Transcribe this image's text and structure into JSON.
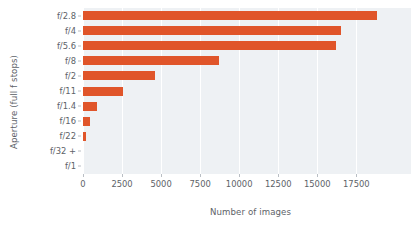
{
  "chart_data": {
    "type": "bar",
    "orientation": "horizontal",
    "title": "",
    "xlabel": "Number of images",
    "ylabel": "Aperture (full f stops)",
    "categories": [
      "f/2.8",
      "f/4",
      "f/5.6",
      "f/8",
      "f/2",
      "f/11",
      "f/1.4",
      "f/16",
      "f/22",
      "f/32 +",
      "f/1"
    ],
    "values": [
      18800,
      16500,
      16200,
      8700,
      4600,
      2550,
      900,
      450,
      200,
      0,
      0
    ],
    "series": [
      {
        "name": "Number of images",
        "values": [
          18800,
          16500,
          16200,
          8700,
          4600,
          2550,
          900,
          450,
          200,
          0,
          0
        ]
      }
    ],
    "xticks": [
      0,
      2500,
      5000,
      7500,
      10000,
      12500,
      15000,
      17500
    ],
    "xticklabels": [
      "0",
      "2500",
      "5000",
      "7500",
      "10000",
      "12500",
      "15000",
      "17500"
    ],
    "xlim": [
      0,
      21000
    ],
    "grid": "vertical",
    "legend": "none",
    "bar_color": "#e0552a",
    "plot_background": "#eef1f4",
    "figure_background": "#ffffff",
    "axis_text_color": "#5d6268"
  }
}
